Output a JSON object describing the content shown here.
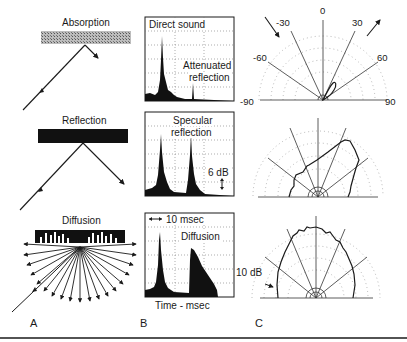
{
  "column_a": {
    "panel_label": "A",
    "rows": [
      {
        "title": "Absorption",
        "surface": "hatched-absorber"
      },
      {
        "title": "Reflection",
        "surface": "solid-reflector"
      },
      {
        "title": "Diffusion",
        "surface": "diffuser-block"
      }
    ]
  },
  "column_b": {
    "panel_label": "B",
    "rows": [
      {
        "label_1": "Direct sound",
        "label_2a": "Attenuated",
        "label_2b": "reflection"
      },
      {
        "label_1a": "Specular",
        "label_1b": "reflection",
        "scale": "6 dB"
      },
      {
        "scale": "10 msec",
        "label": "Diffusion"
      }
    ],
    "xlabel": "Time - msec"
  },
  "column_c": {
    "panel_label": "C",
    "angle_labels": [
      "-90",
      "-60",
      "-30",
      "0",
      "30",
      "60",
      "90"
    ],
    "scale": "10 dB"
  },
  "colors": {
    "ink": "#1a1a1a",
    "grid": "#888888",
    "background": "#ffffff"
  }
}
